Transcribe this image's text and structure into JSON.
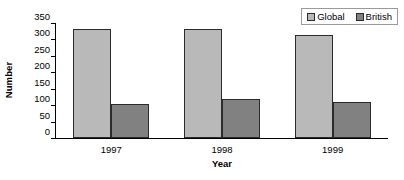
{
  "chart_data": {
    "type": "bar",
    "title": "",
    "xlabel": "Year",
    "ylabel": "Number",
    "categories": [
      "1997",
      "1998",
      "1999"
    ],
    "series": [
      {
        "name": "Global",
        "values": [
          332,
          331,
          313
        ],
        "color": "#b9b9b9"
      },
      {
        "name": "British",
        "values": [
          105,
          118,
          111
        ],
        "color": "#818181"
      }
    ],
    "ylim": [
      0,
      350
    ],
    "yticks": [
      0,
      50,
      100,
      150,
      200,
      250,
      300,
      350
    ],
    "ytick_labels": [
      "0",
      "50",
      "100",
      "150",
      "200",
      "250",
      "300",
      "350"
    ],
    "grid": false,
    "legend_position": "top-right",
    "axis_color": "#000000",
    "bar_border_color": "#2b2b2b",
    "background": "#ffffff"
  },
  "legend": {
    "entries": [
      {
        "label": "Global",
        "color": "#b9b9b9"
      },
      {
        "label": "British",
        "color": "#818181"
      }
    ]
  },
  "axes": {
    "y_title": "Number",
    "x_title": "Year"
  }
}
